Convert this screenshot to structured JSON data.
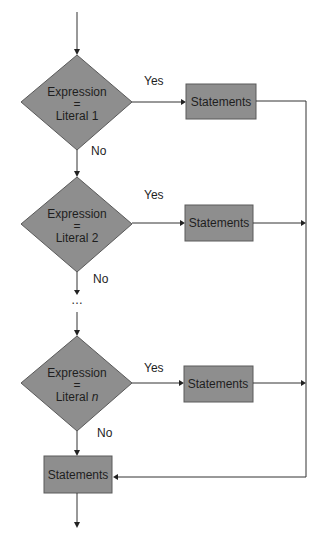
{
  "diagram": {
    "type": "flowchart",
    "title": "",
    "decisions": [
      {
        "line1": "Expression",
        "line2": "=",
        "line3_text": "Literal ",
        "line3_var": "1",
        "yes_label": "Yes",
        "no_label": "No"
      },
      {
        "line1": "Expression",
        "line2": "=",
        "line3_text": "Literal ",
        "line3_var": "2",
        "yes_label": "Yes",
        "no_label": "No"
      },
      {
        "line1": "Expression",
        "line2": "=",
        "line3_text": "Literal ",
        "line3_var": "n",
        "yes_label": "Yes",
        "no_label": "No"
      }
    ],
    "branch_boxes": [
      {
        "label": "Statements"
      },
      {
        "label": "Statements"
      },
      {
        "label": "Statements"
      }
    ],
    "default_box": {
      "label": "Statements"
    },
    "ellipsis": "…"
  },
  "colors": {
    "shape_fill": "#8e8e8e",
    "line": "#333333"
  }
}
